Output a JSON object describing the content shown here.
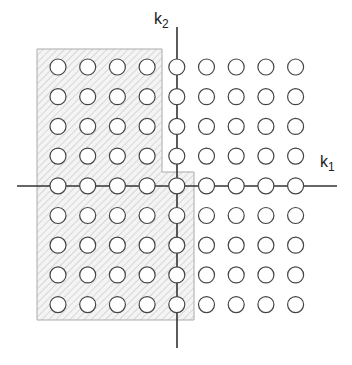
{
  "diagram": {
    "axis_labels": {
      "horizontal": {
        "base": "k",
        "sub": "1"
      },
      "vertical": {
        "base": "k",
        "sub": "2"
      }
    },
    "grid": {
      "columns": 9,
      "rows": 9,
      "x_start": 58,
      "y_start": 67,
      "spacing": 29.7,
      "radius": 8
    },
    "origin": {
      "column": 4,
      "row": 4
    },
    "shaded_region": {
      "description": "Half-plane region: k1 < 0 (all k2), plus k1 = 0 with k2 <= 0",
      "fill": "hatched",
      "points": [
        [
          37,
          49
        ],
        [
          162,
          49
        ],
        [
          162,
          172
        ],
        [
          194,
          172
        ],
        [
          194,
          320
        ],
        [
          37,
          320
        ]
      ]
    },
    "colors": {
      "line": "#333333",
      "circle_stroke": "#444444",
      "circle_fill": "#ffffff",
      "hatch": "#bdbdbd",
      "region_border": "#aaaaaa"
    }
  }
}
